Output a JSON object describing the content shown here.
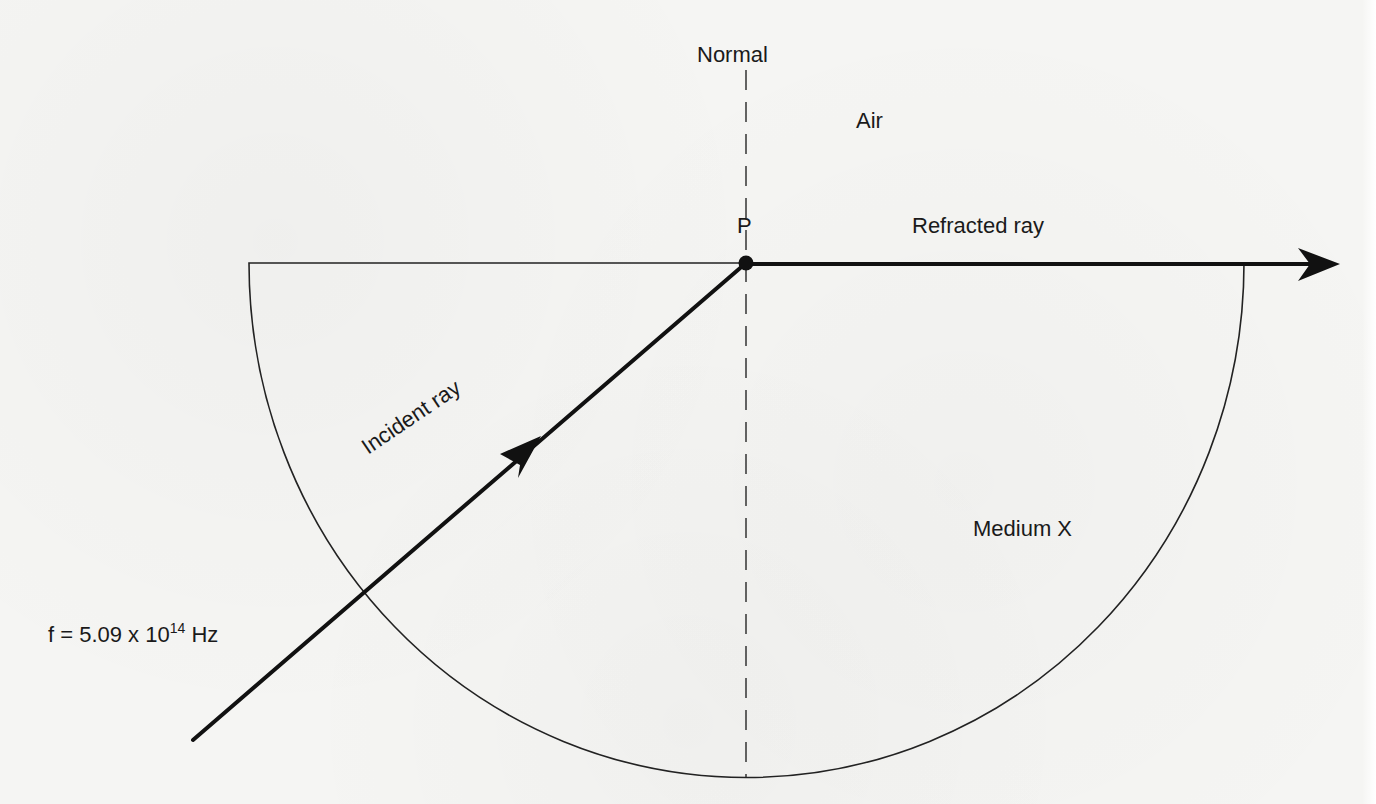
{
  "diagram": {
    "labels": {
      "normal": "Normal",
      "air": "Air",
      "point": "P",
      "refracted_ray": "Refracted ray",
      "medium": "Medium X",
      "incident_ray": "Incident ray",
      "frequency_prefix": "f = 5.09 x 10",
      "frequency_exponent": "14",
      "frequency_unit": " Hz"
    },
    "elements": {
      "semicircular_block": {
        "material": "Medium X",
        "flat_side": "top",
        "center": [
          746,
          263
        ],
        "radius_x": 497,
        "radius_y": 514
      },
      "normal_line": {
        "style": "dashed",
        "x": 746,
        "y_from": 68,
        "y_to": 777
      },
      "incident_ray": {
        "from": [
          193,
          740
        ],
        "to": [
          746,
          263
        ],
        "arrow_direction": "toward P"
      },
      "refracted_ray": {
        "from": [
          746,
          263
        ],
        "to": [
          1340,
          263
        ],
        "direction": "along boundary surface"
      },
      "point_p": {
        "position": [
          746,
          263
        ],
        "marker": "filled circle"
      }
    },
    "colors": {
      "ink": "#111111",
      "paper": "#f5f5f3"
    },
    "frequency_value": "5.09 x 10^14 Hz"
  }
}
